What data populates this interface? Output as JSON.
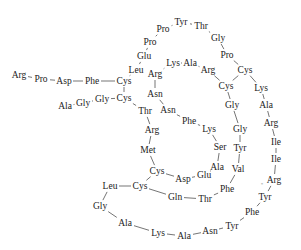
{
  "diagram": {
    "type": "peptide-sequence-structure",
    "colors": {
      "text": "#222222",
      "bond": "#3a3a3a",
      "background": "#ffffff"
    },
    "residues": [
      {
        "id": 0,
        "label": "Arg",
        "x": 19,
        "y": 75
      },
      {
        "id": 1,
        "label": "Pro",
        "x": 41,
        "y": 79
      },
      {
        "id": 2,
        "label": "Asp",
        "x": 64,
        "y": 81
      },
      {
        "id": 3,
        "label": "Phe",
        "x": 92,
        "y": 81
      },
      {
        "id": 4,
        "label": "Cys",
        "x": 124,
        "y": 81
      },
      {
        "id": 5,
        "label": "Leu",
        "x": 136,
        "y": 70
      },
      {
        "id": 6,
        "label": "Glu",
        "x": 144,
        "y": 56
      },
      {
        "id": 7,
        "label": "Pro",
        "x": 150,
        "y": 42
      },
      {
        "id": 8,
        "label": "Pro",
        "x": 163,
        "y": 29
      },
      {
        "id": 9,
        "label": "Tyr",
        "x": 181,
        "y": 22
      },
      {
        "id": 10,
        "label": "Thr",
        "x": 201,
        "y": 26
      },
      {
        "id": 11,
        "label": "Gly",
        "x": 218,
        "y": 38
      },
      {
        "id": 12,
        "label": "Pro",
        "x": 227,
        "y": 55
      },
      {
        "id": 13,
        "label": "Cys",
        "x": 245,
        "y": 70
      },
      {
        "id": 14,
        "label": "Lys",
        "x": 261,
        "y": 88
      },
      {
        "id": 15,
        "label": "Ala",
        "x": 266,
        "y": 105
      },
      {
        "id": 16,
        "label": "Arg",
        "x": 271,
        "y": 123
      },
      {
        "id": 17,
        "label": "Ile",
        "x": 276,
        "y": 142
      },
      {
        "id": 18,
        "label": "Ile",
        "x": 276,
        "y": 159
      },
      {
        "id": 19,
        "label": "Arg",
        "x": 274,
        "y": 180
      },
      {
        "id": 20,
        "label": "Tyr",
        "x": 265,
        "y": 197
      },
      {
        "id": 21,
        "label": "Phe",
        "x": 252,
        "y": 212
      },
      {
        "id": 22,
        "label": "Tyr",
        "x": 232,
        "y": 226
      },
      {
        "id": 23,
        "label": "Asn",
        "x": 210,
        "y": 231
      },
      {
        "id": 24,
        "label": "Ala",
        "x": 184,
        "y": 236
      },
      {
        "id": 25,
        "label": "Lys",
        "x": 158,
        "y": 233
      },
      {
        "id": 26,
        "label": "Ala",
        "x": 125,
        "y": 223
      },
      {
        "id": 27,
        "label": "Gly",
        "x": 100,
        "y": 206
      },
      {
        "id": 28,
        "label": "Leu",
        "x": 110,
        "y": 186
      },
      {
        "id": 29,
        "label": "Cys",
        "x": 140,
        "y": 186
      },
      {
        "id": 30,
        "label": "Gln",
        "x": 175,
        "y": 197
      },
      {
        "id": 31,
        "label": "Thr",
        "x": 205,
        "y": 199
      },
      {
        "id": 32,
        "label": "Phe",
        "x": 227,
        "y": 189
      },
      {
        "id": 33,
        "label": "Val",
        "x": 238,
        "y": 169
      },
      {
        "id": 34,
        "label": "Tyr",
        "x": 240,
        "y": 148
      },
      {
        "id": 35,
        "label": "Gly",
        "x": 240,
        "y": 129
      },
      {
        "id": 36,
        "label": "Gly",
        "x": 232,
        "y": 105
      },
      {
        "id": 37,
        "label": "Cys",
        "x": 226,
        "y": 86
      },
      {
        "id": 38,
        "label": "Arg",
        "x": 208,
        "y": 70
      },
      {
        "id": 39,
        "label": "Ala",
        "x": 190,
        "y": 63
      },
      {
        "id": 40,
        "label": "Lys",
        "x": 173,
        "y": 63
      },
      {
        "id": 41,
        "label": "Arg",
        "x": 155,
        "y": 74
      },
      {
        "id": 42,
        "label": "Asn",
        "x": 155,
        "y": 94
      },
      {
        "id": 43,
        "label": "Asn",
        "x": 168,
        "y": 110
      },
      {
        "id": 44,
        "label": "Phe",
        "x": 189,
        "y": 121
      },
      {
        "id": 45,
        "label": "Lys",
        "x": 209,
        "y": 129
      },
      {
        "id": 46,
        "label": "Ser",
        "x": 220,
        "y": 147
      },
      {
        "id": 47,
        "label": "Ala",
        "x": 217,
        "y": 167
      },
      {
        "id": 48,
        "label": "Glu",
        "x": 204,
        "y": 175
      },
      {
        "id": 49,
        "label": "Asp",
        "x": 183,
        "y": 179
      },
      {
        "id": 50,
        "label": "Cys",
        "x": 157,
        "y": 171
      },
      {
        "id": 51,
        "label": "Met",
        "x": 148,
        "y": 150
      },
      {
        "id": 52,
        "label": "Arg",
        "x": 152,
        "y": 130
      },
      {
        "id": 53,
        "label": "Thr",
        "x": 145,
        "y": 111
      },
      {
        "id": 54,
        "label": "Cys",
        "x": 124,
        "y": 98
      },
      {
        "id": 55,
        "label": "Gly",
        "x": 102,
        "y": 99
      },
      {
        "id": 56,
        "label": "Gly",
        "x": 83,
        "y": 103
      },
      {
        "id": 57,
        "label": "Ala",
        "x": 65,
        "y": 106
      }
    ],
    "bonds": [
      [
        0,
        1
      ],
      [
        1,
        2
      ],
      [
        2,
        3
      ],
      [
        3,
        4
      ],
      [
        4,
        5
      ],
      [
        5,
        6
      ],
      [
        6,
        7
      ],
      [
        7,
        8
      ],
      [
        8,
        9
      ],
      [
        9,
        10
      ],
      [
        10,
        11
      ],
      [
        11,
        12
      ],
      [
        12,
        13
      ],
      [
        13,
        14
      ],
      [
        14,
        15
      ],
      [
        15,
        16
      ],
      [
        16,
        17
      ],
      [
        17,
        18
      ],
      [
        18,
        19
      ],
      [
        19,
        20
      ],
      [
        20,
        21
      ],
      [
        21,
        22
      ],
      [
        22,
        23
      ],
      [
        23,
        24
      ],
      [
        24,
        25
      ],
      [
        25,
        26
      ],
      [
        26,
        27
      ],
      [
        27,
        28
      ],
      [
        28,
        29
      ],
      [
        29,
        30
      ],
      [
        30,
        31
      ],
      [
        31,
        32
      ],
      [
        32,
        33
      ],
      [
        33,
        34
      ],
      [
        34,
        35
      ],
      [
        35,
        36
      ],
      [
        36,
        37
      ],
      [
        37,
        38
      ],
      [
        38,
        39
      ],
      [
        39,
        40
      ],
      [
        40,
        41
      ],
      [
        41,
        42
      ],
      [
        42,
        43
      ],
      [
        43,
        44
      ],
      [
        44,
        45
      ],
      [
        45,
        46
      ],
      [
        46,
        47
      ],
      [
        47,
        48
      ],
      [
        48,
        49
      ],
      [
        49,
        50
      ],
      [
        50,
        51
      ],
      [
        51,
        52
      ],
      [
        52,
        53
      ],
      [
        53,
        54
      ],
      [
        54,
        55
      ],
      [
        55,
        56
      ],
      [
        56,
        57
      ],
      [
        4,
        54
      ],
      [
        13,
        37
      ],
      [
        29,
        50
      ]
    ],
    "annotations": [
      {
        "label": "*",
        "x": 262,
        "y": 186
      }
    ]
  }
}
